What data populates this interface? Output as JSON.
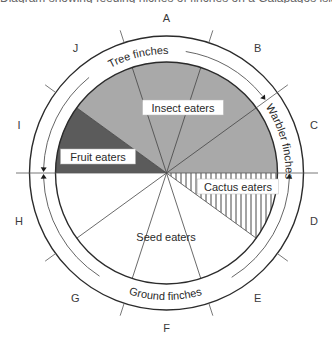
{
  "diagram": {
    "center": {
      "x": 166.5,
      "y": 173
    },
    "radii": {
      "pie": 111,
      "arrow_ring": 123,
      "outer": 137,
      "tick_outer": 150
    },
    "colors": {
      "insect": "#a9a9a9",
      "fruit": "#5b5b5b",
      "cactus_hatch": "#333333",
      "seed": "#ffffff",
      "stroke": "#2b2b2b",
      "thin_stroke": "#555555"
    },
    "sector_letters": [
      {
        "letter": "A",
        "angle": 0
      },
      {
        "letter": "B",
        "angle": 36
      },
      {
        "letter": "C",
        "angle": 72
      },
      {
        "letter": "D",
        "angle": 108
      },
      {
        "letter": "E",
        "angle": 144
      },
      {
        "letter": "F",
        "angle": 180
      },
      {
        "letter": "G",
        "angle": 216
      },
      {
        "letter": "H",
        "angle": 252
      },
      {
        "letter": "I",
        "angle": 288
      },
      {
        "letter": "J",
        "angle": 324
      }
    ],
    "tick_angles": [
      18,
      54,
      126,
      162,
      198,
      234,
      306,
      342
    ],
    "pie_radial_lines": [
      306,
      342,
      18,
      54,
      126,
      162,
      198,
      234
    ],
    "regions": [
      {
        "name": "Insect eaters",
        "from": 306,
        "to": 450,
        "fill": "insect"
      },
      {
        "name": "Fruit eaters",
        "from": 270,
        "to": 306,
        "fill": "fruit"
      },
      {
        "name": "Cactus eaters",
        "from": 90,
        "to": 126,
        "fill": "hatch"
      },
      {
        "name": "Seed eaters",
        "from": 126,
        "to": 270,
        "fill": "seed"
      }
    ],
    "labels": {
      "insect": "Insect eaters",
      "fruit": "Fruit eaters",
      "cactus": "Cactus eaters",
      "seed": "Seed eaters",
      "tree_finches": "Tree finches",
      "warbler_finches": "Warbler finches",
      "ground_finches": "Ground finches"
    },
    "top_cut_text": "Diagram showing feeding niches of finches on a Galápagos island"
  }
}
